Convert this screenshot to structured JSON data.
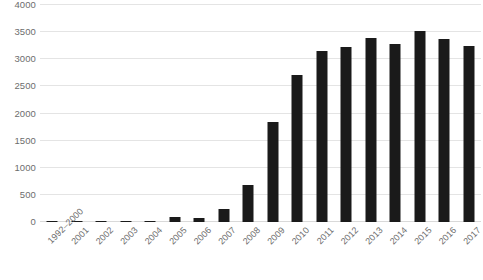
{
  "chart_data": {
    "type": "bar",
    "title": "",
    "subtitle": "",
    "xlabel": "",
    "ylabel": "",
    "categories": [
      "1992–2000",
      "2001",
      "2002",
      "2003",
      "2004",
      "2005",
      "2006",
      "2007",
      "2008",
      "2009",
      "2010",
      "2011",
      "2012",
      "2013",
      "2014",
      "2015",
      "2016",
      "2017"
    ],
    "values": [
      10,
      12,
      12,
      12,
      15,
      85,
      80,
      240,
      680,
      1850,
      2710,
      3150,
      3220,
      3390,
      3280,
      3530,
      3370,
      3250
    ],
    "series": [
      {
        "name": "count",
        "values": [
          10,
          12,
          12,
          12,
          15,
          85,
          80,
          240,
          680,
          1850,
          2710,
          3150,
          3220,
          3390,
          3280,
          3530,
          3370,
          3250
        ]
      }
    ],
    "ylim": [
      0,
      4000
    ],
    "yticks": [
      0,
      500,
      1000,
      1500,
      2000,
      2500,
      3000,
      3500,
      4000
    ],
    "ytick_labels": [
      "0",
      "500",
      "1000",
      "1500",
      "2000",
      "2500",
      "3000",
      "3500",
      "4000"
    ],
    "grid": true,
    "grid_axis": "y",
    "legend": false,
    "legend_position": "none",
    "bar_color": "#1a1a1a",
    "grid_color": "#e4e4e4",
    "tick_label_color": "#6d6d6d",
    "xtick_label_rotation": -45
  }
}
